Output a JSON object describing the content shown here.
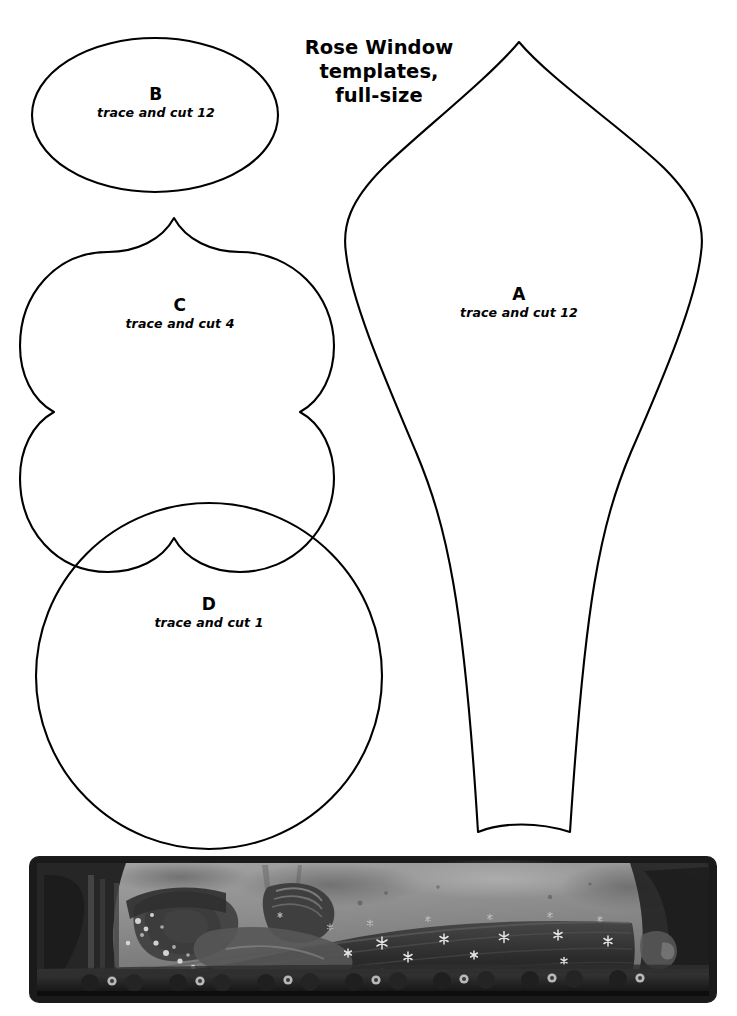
{
  "document": {
    "title_lines": [
      "Rose Window",
      "templates,",
      "full-size"
    ],
    "background_color": "#ffffff",
    "outline_color": "#000000",
    "page_size": {
      "width": 737,
      "height": 1016
    }
  },
  "templates": [
    {
      "id": "A",
      "letter": "A",
      "instruction": "trace and cut 12",
      "shape": "pointed-gothic-petal",
      "quantity": 12
    },
    {
      "id": "B",
      "letter": "B",
      "instruction": "trace and cut 12",
      "shape": "ellipse",
      "quantity": 12
    },
    {
      "id": "C",
      "letter": "C",
      "instruction": "trace and cut 4",
      "shape": "quatrefoil",
      "quantity": 4
    },
    {
      "id": "D",
      "letter": "D",
      "instruction": "trace and cut 1",
      "shape": "circle",
      "quantity": 1
    }
  ],
  "photo": {
    "caption": "",
    "subject": "medieval stone effigy on tomb chest",
    "palette": {
      "frame": "#1b1b1b",
      "wall_light": "#9a9a9a",
      "wall_mid": "#7c7c7c",
      "robe_dark": "#2a2a2a",
      "robe_mid": "#3e3e3e",
      "highlight": "#e8e8e8",
      "base_dark": "#141414"
    }
  }
}
